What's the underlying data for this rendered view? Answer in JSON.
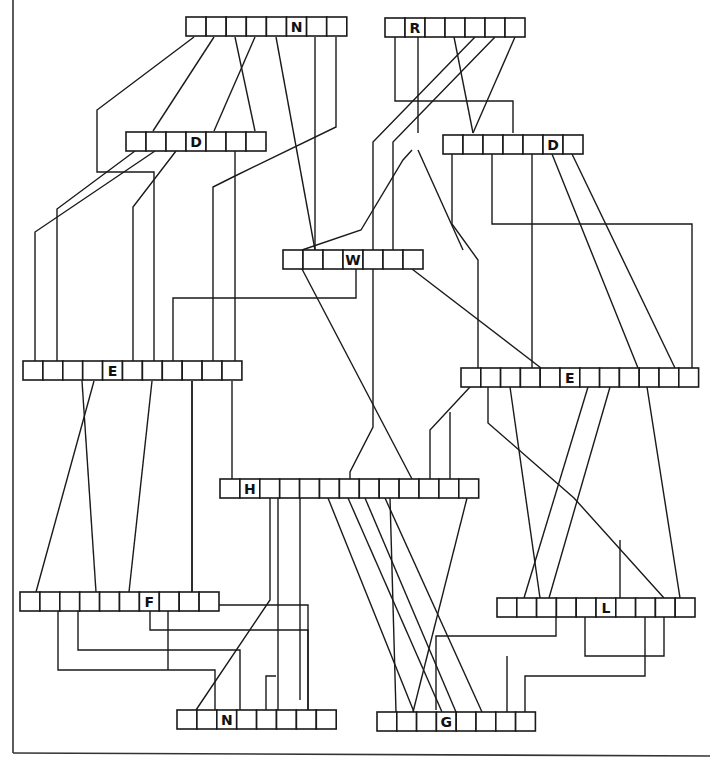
{
  "diagram": {
    "stroke_color": "#1a1a1a",
    "background": "#ffffff",
    "cell_height": 19,
    "boxes": [
      {
        "id": "N_top",
        "label": "N",
        "x": 186,
        "y": 17,
        "cells": 8,
        "label_cell": 6,
        "cell_w": 20.1
      },
      {
        "id": "R_top",
        "label": "R",
        "x": 385,
        "y": 18,
        "cells": 7,
        "label_cell": 2,
        "cell_w": 20.0
      },
      {
        "id": "D_left",
        "label": "D",
        "x": 126,
        "y": 132,
        "cells": 7,
        "label_cell": 4,
        "cell_w": 20.0
      },
      {
        "id": "D_right",
        "label": "D",
        "x": 443,
        "y": 135,
        "cells": 7,
        "label_cell": 6,
        "cell_w": 20.0
      },
      {
        "id": "W",
        "label": "W",
        "x": 283,
        "y": 250,
        "cells": 7,
        "label_cell": 4,
        "cell_w": 20.0
      },
      {
        "id": "E_left",
        "label": "E",
        "x": 23,
        "y": 361,
        "cells": 11,
        "label_cell": 5,
        "cell_w": 19.9
      },
      {
        "id": "E_right",
        "label": "E",
        "x": 461,
        "y": 368,
        "cells": 12,
        "label_cell": 6,
        "cell_w": 19.8
      },
      {
        "id": "H",
        "label": "H",
        "x": 220,
        "y": 479,
        "cells": 13,
        "label_cell": 2,
        "cell_w": 19.9
      },
      {
        "id": "F",
        "label": "F",
        "x": 20,
        "y": 592,
        "cells": 10,
        "label_cell": 7,
        "cell_w": 19.9
      },
      {
        "id": "L",
        "label": "L",
        "x": 497,
        "y": 598,
        "cells": 10,
        "label_cell": 6,
        "cell_w": 19.8
      },
      {
        "id": "N_bottom",
        "label": "N",
        "x": 177,
        "y": 710,
        "cells": 8,
        "label_cell": 3,
        "cell_w": 19.9
      },
      {
        "id": "G",
        "label": "G",
        "x": 377,
        "y": 712,
        "cells": 8,
        "label_cell": 4,
        "cell_w": 19.8
      }
    ],
    "wires": [
      "194,37 97,110 97,172 154,172 154,361",
      "214,37 153,131",
      "235,37 255,131",
      "255,37 214,131",
      "276,37 315,250",
      "315,37 315,250",
      "336,37 336,127 233,177 213,187 213,361",
      "135,151 57,209 57,361",
      "155,151 35,232 35,361",
      "176,151 133,207 133,361",
      "235,151 235,361",
      "395,37 395,101 513,101 513,133",
      "454,37 473,133",
      "418,37 418,133",
      "475,37 373,142 373,250",
      "495,37 393,142 393,250",
      "515,37 473,133",
      "452,154 452,224 478,260 478,368",
      "492,154 492,224 692,224 692,368",
      "532,154 532,368",
      "552,154 638,368",
      "572,154 675,368",
      "302,269 412,479",
      "373,269 373,427 350,472 350,479",
      "412,269 541,368",
      "356,269 356,298 173,298 173,361",
      "412,150 403,160 361,230 302,250",
      "463,250 418,150",
      "82,381 96,592",
      "94,381 36,592",
      "152,381 129,592",
      "192,381 192,592",
      "232,381 232,479",
      "192,381 192,592",
      "470,387 430,430 430,479",
      "450,412 450,479",
      "488,387 488,423 574,498 664,598",
      "510,387 540,598",
      "588,387 524,598",
      "610,387 549,598",
      "647,387 680,598",
      "300,498 300,700",
      "278,498 278,710",
      "328,498 414,712",
      "348,498 442,712",
      "365,498 456,712",
      "385,498 482,712",
      "390,498 396,712",
      "467,498 413,712",
      "58,611 58,670 215,670 215,710",
      "78,611 78,650 240,650 240,710",
      "150,611 150,630 308,630 308,710",
      "168,611 168,670",
      "218,605 308,605 308,710",
      "270,498 270,600 196,710",
      "276,676 266,676 266,710",
      "556,617 556,636 436,636 436,710",
      "585,617 585,656 664,656 664,617",
      "507,656 507,712",
      "645,617 645,676 525,676 525,712",
      "620,540 620,598"
    ],
    "page_border": {
      "left_x": 13,
      "bottom_y": 753
    }
  }
}
